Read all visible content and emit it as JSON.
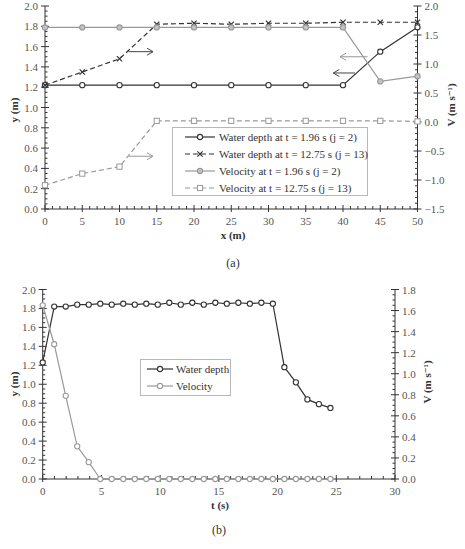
{
  "chart_data": [
    {
      "id": "a",
      "type": "line",
      "caption": "(a)",
      "title": "",
      "xlabel": "x (m)",
      "ylabel": "y (m)",
      "y2label": "V (m s⁻¹)",
      "xlim": [
        0,
        50
      ],
      "ylim": [
        0,
        2.0
      ],
      "y2lim": [
        -1.5,
        2.0
      ],
      "grid": false,
      "legend_position": "center-bottom",
      "xticks": [
        0,
        5,
        10,
        15,
        20,
        25,
        30,
        35,
        40,
        45,
        50
      ],
      "xtick_labels": [
        "0",
        "5",
        "10",
        "15",
        "20",
        "25",
        "30",
        "35",
        "40",
        "45",
        "50"
      ],
      "yticks": [
        0,
        0.2,
        0.4,
        0.6,
        0.8,
        1.0,
        1.2,
        1.4,
        1.6,
        1.8,
        2.0
      ],
      "ytick_labels": [
        "0.0",
        "0.2",
        "0.4",
        "0.6",
        "0.8",
        "1.0",
        "1.2",
        "1.4",
        "1.6",
        "1.8",
        "2.0"
      ],
      "y2ticks": [
        -1.5,
        -1.0,
        -0.5,
        0,
        0.5,
        1.0,
        1.5,
        2.0
      ],
      "y2tick_labels": [
        "−1.5",
        "−1.0",
        "−0.5",
        "0.0",
        "0.5",
        "1.0",
        "1.5",
        "2.0"
      ],
      "x": [
        0,
        5,
        10,
        15,
        20,
        25,
        30,
        35,
        40,
        45,
        50
      ],
      "series": [
        {
          "name": "Water depth at t = 1.96 s (j = 2)",
          "axis": "left",
          "line": "solid",
          "marker": "circle-open",
          "color": "#333333",
          "values": [
            1.22,
            1.22,
            1.22,
            1.22,
            1.22,
            1.22,
            1.22,
            1.22,
            1.22,
            1.55,
            1.79
          ]
        },
        {
          "name": "Water depth at t = 12.75 s (j = 13)",
          "axis": "left",
          "line": "dashed",
          "marker": "x",
          "color": "#333333",
          "values": [
            1.22,
            1.35,
            1.48,
            1.82,
            1.83,
            1.82,
            1.83,
            1.83,
            1.84,
            1.84,
            1.84
          ]
        },
        {
          "name": "Velocity at t = 1.96 s (j = 2)",
          "axis": "right",
          "line": "solid",
          "marker": "circle-filled",
          "color": "#999999",
          "values": [
            1.63,
            1.63,
            1.63,
            1.63,
            1.63,
            1.63,
            1.63,
            1.63,
            1.63,
            0.7,
            0.79
          ]
        },
        {
          "name": "Velocity at t = 12.75 s (j = 13)",
          "axis": "right",
          "line": "dashed",
          "marker": "square-open",
          "color": "#999999",
          "values": [
            -1.09,
            -0.89,
            -0.77,
            0.02,
            0.02,
            0.02,
            0.02,
            0.02,
            0.02,
            0.02,
            0.01
          ]
        }
      ],
      "annotations": [
        {
          "type": "arrow",
          "direction": "right",
          "color": "#444444",
          "x_from": 11.2,
          "x_to": 14.5,
          "y": 1.55
        },
        {
          "type": "arrow",
          "direction": "right",
          "color": "#999999",
          "x_from": 11.2,
          "x_to": 14.5,
          "y": 0.52
        },
        {
          "type": "arrow",
          "direction": "left",
          "color": "#999999",
          "x_from": 43.3,
          "x_to": 39.6,
          "y": 1.5
        },
        {
          "type": "arrow",
          "direction": "left",
          "color": "#444444",
          "x_from": 41.6,
          "x_to": 38.7,
          "y": 1.34
        }
      ]
    },
    {
      "id": "b",
      "type": "line",
      "caption": "(b)",
      "title": "",
      "xlabel": "t (s)",
      "ylabel": "y (m)",
      "y2label": "V (m s⁻¹)",
      "xlim": [
        0,
        30
      ],
      "ylim": [
        0,
        2.0
      ],
      "y2lim": [
        0,
        1.8
      ],
      "grid": false,
      "legend_position": "center-left",
      "xticks": [
        0,
        5,
        10,
        15,
        20,
        25,
        30
      ],
      "xtick_labels": [
        "0",
        "5",
        "10",
        "15",
        "20",
        "25",
        "30"
      ],
      "yticks": [
        0,
        0.2,
        0.4,
        0.6,
        0.8,
        1.0,
        1.2,
        1.4,
        1.6,
        1.8,
        2.0
      ],
      "ytick_labels": [
        "0.0",
        "0.2",
        "0.4",
        "0.6",
        "0.8",
        "1.0",
        "1.2",
        "1.4",
        "1.6",
        "1.8",
        "2.0"
      ],
      "y2ticks": [
        0,
        0.2,
        0.4,
        0.6,
        0.8,
        1.0,
        1.2,
        1.4,
        1.6,
        1.8
      ],
      "y2tick_labels": [
        "0.0",
        "0.2",
        "0.4",
        "0.6",
        "0.8",
        "1.0",
        "1.2",
        "1.4",
        "1.6",
        "1.8"
      ],
      "x": [
        0,
        0.98,
        1.96,
        2.94,
        3.92,
        4.9,
        5.88,
        6.86,
        7.84,
        8.82,
        9.8,
        10.78,
        11.76,
        12.74,
        13.72,
        14.7,
        15.68,
        16.66,
        17.64,
        18.62,
        19.6,
        20.58,
        21.56,
        22.54,
        23.52,
        24.5
      ],
      "series": [
        {
          "name": "Water depth",
          "axis": "left",
          "line": "solid",
          "marker": "circle-open",
          "color": "#333333",
          "values": [
            1.23,
            1.82,
            1.82,
            1.84,
            1.84,
            1.85,
            1.84,
            1.85,
            1.84,
            1.85,
            1.84,
            1.86,
            1.84,
            1.86,
            1.84,
            1.86,
            1.85,
            1.86,
            1.85,
            1.86,
            1.85,
            1.18,
            1.02,
            0.84,
            0.79,
            0.75
          ]
        },
        {
          "name": "Velocity",
          "axis": "right",
          "line": "solid",
          "marker": "circle-open",
          "color": "#9a9a9a",
          "values": [
            1.65,
            1.28,
            0.79,
            0.31,
            0.16,
            0,
            0,
            0,
            0,
            0,
            0,
            0,
            0,
            0,
            0,
            0,
            0,
            0,
            0,
            0,
            0,
            0,
            0,
            0,
            0,
            0
          ]
        }
      ],
      "annotations": []
    }
  ]
}
